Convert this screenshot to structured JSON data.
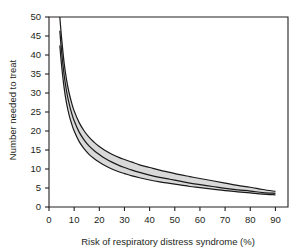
{
  "chart_data": {
    "type": "line",
    "title": "",
    "subtitle": "",
    "xlabel": "Risk of respiratory distress syndrome (%)",
    "ylabel": "Number needed to treat",
    "xlim": [
      0,
      95
    ],
    "ylim": [
      0,
      50
    ],
    "xticks": [
      0,
      10,
      20,
      30,
      40,
      50,
      60,
      70,
      80,
      90
    ],
    "yticks": [
      0,
      5,
      10,
      15,
      20,
      25,
      30,
      35,
      40,
      45,
      50
    ],
    "xtick_labels": [
      "0",
      "10",
      "20",
      "30",
      "40",
      "50",
      "60",
      "70",
      "80",
      "90"
    ],
    "ytick_labels": [
      "0",
      "5",
      "10",
      "15",
      "20",
      "25",
      "30",
      "35",
      "40",
      "45",
      "50"
    ],
    "grid": false,
    "legend": "none",
    "x": [
      4.3,
      5,
      6,
      7,
      8,
      9,
      10,
      12,
      14,
      16,
      18,
      20,
      22,
      25,
      28,
      30,
      33,
      36,
      40,
      44,
      48,
      52,
      56,
      60,
      65,
      70,
      75,
      80,
      85,
      90
    ],
    "series": [
      {
        "name": "Upper 95% confidence limit",
        "values": [
          50.0,
          44.5,
          38.0,
          33.4,
          30.0,
          27.4,
          25.3,
          22.2,
          20.0,
          18.3,
          17.0,
          15.9,
          15.0,
          13.9,
          13.0,
          12.5,
          11.8,
          11.1,
          10.4,
          9.7,
          9.1,
          8.5,
          8.0,
          7.5,
          6.9,
          6.3,
          5.7,
          5.2,
          4.6,
          4.1
        ]
      },
      {
        "name": "Point estimate",
        "values": [
          46.4,
          41.0,
          34.8,
          30.4,
          27.2,
          24.7,
          22.7,
          19.7,
          17.6,
          16.0,
          14.8,
          13.8,
          12.9,
          11.8,
          10.9,
          10.4,
          9.7,
          9.1,
          8.4,
          7.8,
          7.3,
          6.8,
          6.3,
          5.9,
          5.4,
          4.9,
          4.5,
          4.2,
          3.8,
          3.6
        ]
      },
      {
        "name": "Lower 95% confidence limit",
        "values": [
          42.5,
          37.3,
          31.4,
          27.2,
          24.2,
          21.9,
          20.0,
          17.2,
          15.3,
          13.8,
          12.7,
          11.8,
          11.0,
          10.0,
          9.2,
          8.8,
          8.2,
          7.7,
          7.1,
          6.6,
          6.2,
          5.8,
          5.4,
          5.1,
          4.7,
          4.3,
          4.0,
          3.7,
          3.4,
          3.2
        ]
      }
    ],
    "band_fill": "#d9d9d9",
    "line_color": "#1a1a1a",
    "axis_color": "#231f20",
    "background": "#ffffff"
  }
}
